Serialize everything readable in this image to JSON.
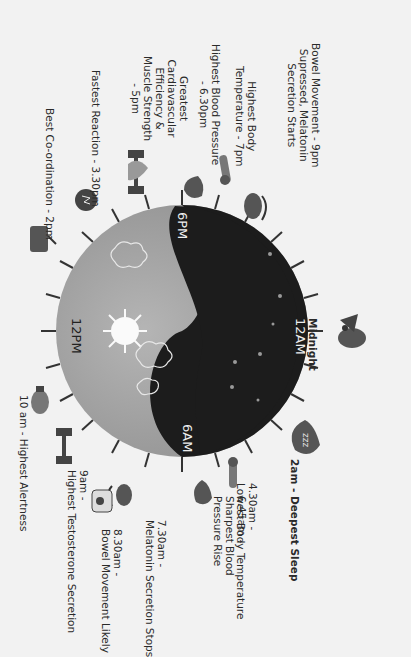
{
  "diagram": {
    "orientation": "rotated 90deg clockwise",
    "colors": {
      "day": "#a6a6a6",
      "night": "#1c1c1c",
      "background": "#f2f2f2",
      "icon": "#555555"
    },
    "clock_labels": {
      "noon": "12PM",
      "midnight_face": "12AM",
      "evening": "6PM",
      "morning": "6AM"
    },
    "events": [
      {
        "id": "midnight",
        "lines": [
          "Midnight"
        ],
        "icon": "bird-icon"
      },
      {
        "id": "deep-sleep",
        "lines": [
          "2am - Deepest Sleep"
        ],
        "icon": "zzz-drop-icon"
      },
      {
        "id": "low-temp",
        "lines": [
          "4.30am -",
          "Lowest Body Temperature"
        ],
        "icon": "thermometer-icon"
      },
      {
        "id": "bp-rise",
        "lines": [
          "6.45am -",
          "Sharpest Blood",
          "Pressure Rise"
        ],
        "icon": "drop-pulse-icon"
      },
      {
        "id": "melatonin-stop",
        "lines": [
          "7.30am -",
          "Melatonin Secretion Stops"
        ],
        "icon": "eye-icon"
      },
      {
        "id": "bowel-likely",
        "lines": [
          "8.30am -",
          "Bowel Movement Likely"
        ],
        "icon": "toilet-roll-icon"
      },
      {
        "id": "testosterone",
        "lines": [
          "9am -",
          "Highest Testosterone Secretion"
        ],
        "icon": "dumbbell-icon"
      },
      {
        "id": "alertness",
        "lines": [
          "10 am - Highest Alertness"
        ],
        "icon": "lightbulb-icon"
      },
      {
        "id": "coordination",
        "lines": [
          "Best Co-ordination - 2pm"
        ],
        "icon": "drum-icon"
      },
      {
        "id": "reaction",
        "lines": [
          "Fastest Reaction - 3.30pm"
        ],
        "icon": "lightning-icon"
      },
      {
        "id": "cardio",
        "lines": [
          "Greatest",
          "Cardiavascular",
          "Efficiency &",
          "Muscle Strength",
          "- 5pm"
        ],
        "icon": "heart-dumbbell-icon"
      },
      {
        "id": "high-bp",
        "lines": [
          "Highest Blood Pressure",
          "- 6.30pm"
        ],
        "icon": "drop-lightning-icon"
      },
      {
        "id": "high-temp",
        "lines": [
          "Highest Body",
          "Temperature - 7pm"
        ],
        "icon": "thermometer-icon"
      },
      {
        "id": "bowel-suppressed",
        "lines": [
          "Bowel Movement - 9pm",
          "Supressed, Melatonin",
          "Secretion Starts"
        ],
        "icon": "eye-icon"
      }
    ]
  }
}
